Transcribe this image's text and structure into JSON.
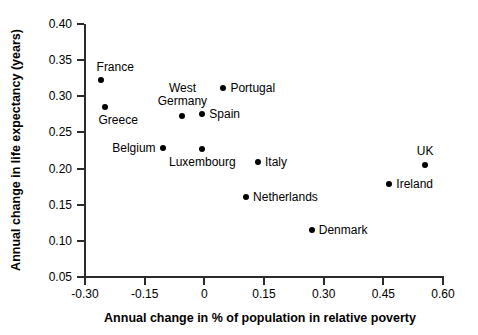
{
  "chart_data": {
    "type": "scatter",
    "title": "",
    "xlabel": "Annual change in % of population in relative poverty",
    "ylabel": "Annual change in life expectancy (years)",
    "xlim": [
      -0.3,
      0.6
    ],
    "ylim": [
      0.05,
      0.4
    ],
    "grid": false,
    "legend": "none",
    "xticks": [
      "-0.30",
      "-0.15",
      "0",
      "0.15",
      "0.30",
      "0.45",
      "0.60"
    ],
    "xtick_values": [
      -0.3,
      -0.15,
      0,
      0.15,
      0.3,
      0.45,
      0.6
    ],
    "yticks": [
      "0.05",
      "0.10",
      "0.15",
      "0.20",
      "0.25",
      "0.30",
      "0.35",
      "0.40"
    ],
    "ytick_values": [
      0.05,
      0.1,
      0.15,
      0.2,
      0.25,
      0.3,
      0.35,
      0.4
    ],
    "points": [
      {
        "label": "France",
        "x": -0.26,
        "y": 0.323,
        "label_pos": "above-left"
      },
      {
        "label": "Greece",
        "x": -0.25,
        "y": 0.285,
        "label_pos": "below-left"
      },
      {
        "label": "West\nGermany",
        "x": -0.055,
        "y": 0.273,
        "label_pos": "above-center"
      },
      {
        "label": "Spain",
        "x": -0.005,
        "y": 0.275,
        "label_pos": "right"
      },
      {
        "label": "Portugal",
        "x": 0.048,
        "y": 0.312,
        "label_pos": "right"
      },
      {
        "label": "Belgium",
        "x": -0.105,
        "y": 0.229,
        "label_pos": "left"
      },
      {
        "label": "Luxembourg",
        "x": -0.005,
        "y": 0.227,
        "label_pos": "below-center"
      },
      {
        "label": "Italy",
        "x": 0.135,
        "y": 0.209,
        "label_pos": "right"
      },
      {
        "label": "Netherlands",
        "x": 0.105,
        "y": 0.16,
        "label_pos": "right"
      },
      {
        "label": "Denmark",
        "x": 0.27,
        "y": 0.115,
        "label_pos": "right"
      },
      {
        "label": "Ireland",
        "x": 0.465,
        "y": 0.178,
        "label_pos": "right"
      },
      {
        "label": "UK",
        "x": 0.555,
        "y": 0.205,
        "label_pos": "above-center"
      }
    ],
    "marker_color": "#000000",
    "axis_color": "#2b2b2b"
  }
}
